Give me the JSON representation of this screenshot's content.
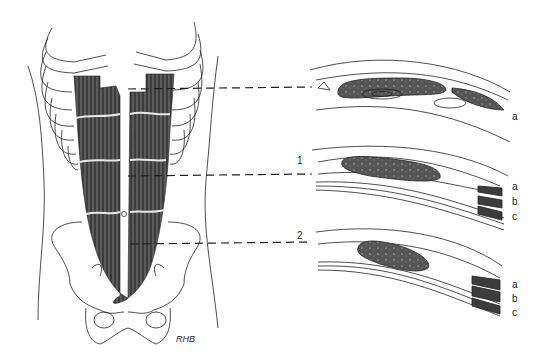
{
  "figure": {
    "panels": [
      {
        "id": "top",
        "level_marker": "",
        "layer_labels": [
          "a"
        ]
      },
      {
        "id": "middle",
        "level_marker": "1",
        "layer_labels": [
          "a",
          "b",
          "c"
        ]
      },
      {
        "id": "bottom",
        "level_marker": "2",
        "layer_labels": [
          "a",
          "b",
          "c"
        ]
      }
    ],
    "signature": "RHB",
    "colors": {
      "muscle": "#4a4a4a",
      "line": "#222222",
      "background": "#ffffff"
    }
  }
}
